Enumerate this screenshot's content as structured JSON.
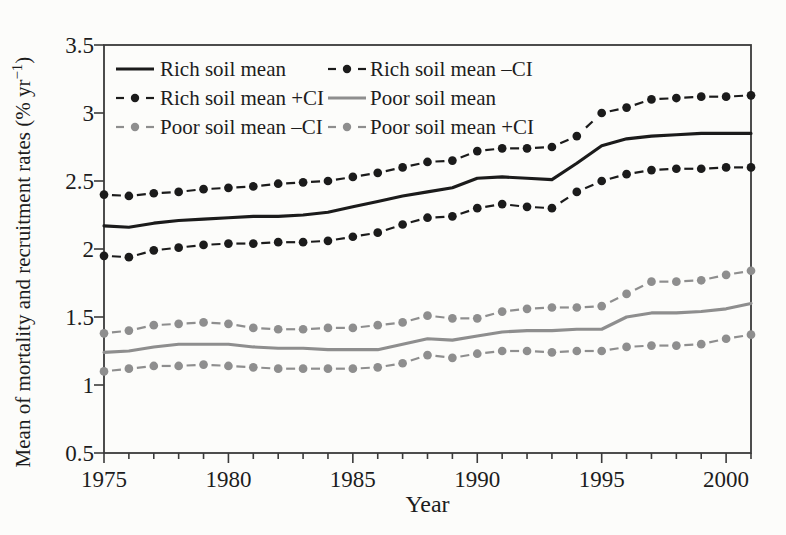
{
  "figure": {
    "kind": "scanned-book-line-chart",
    "background": "#fcfcfa",
    "frame_color": "#3a3a3a",
    "text_color": "#1d1d1d"
  },
  "chart_data": {
    "type": "line",
    "title": "",
    "xlabel": "Year",
    "ylabel": "Mean of mortality and recruitment rates (% yr−1)",
    "ylabel_parts": {
      "prefix": "Mean of mortality and recruitment rates (% yr",
      "sup": "−1",
      "suffix": ")"
    },
    "xlim": [
      1975,
      2001
    ],
    "ylim": [
      0.5,
      3.5
    ],
    "grid": false,
    "legend_position": "top-left-inside",
    "x_major_ticks": [
      1975,
      1980,
      1985,
      1990,
      1995,
      2000
    ],
    "x_tick_labels": [
      "1975",
      "1980",
      "1985",
      "1990",
      "1995",
      "2000"
    ],
    "x_minor_step": 1,
    "y_major_ticks": [
      0.5,
      1,
      1.5,
      2,
      2.5,
      3,
      3.5
    ],
    "y_tick_labels": [
      "0.5",
      "1",
      "1.5",
      "2",
      "2.5",
      "3",
      "3.5"
    ],
    "x": [
      1975,
      1976,
      1977,
      1978,
      1979,
      1980,
      1981,
      1982,
      1983,
      1984,
      1985,
      1986,
      1987,
      1988,
      1989,
      1990,
      1991,
      1992,
      1993,
      1994,
      1995,
      1996,
      1997,
      1998,
      1999,
      2000,
      2001
    ],
    "series": [
      {
        "name": "Rich soil mean",
        "style": "solid",
        "color": "#1b1b1b",
        "marker": "none",
        "values": [
          2.17,
          2.16,
          2.19,
          2.21,
          2.22,
          2.23,
          2.24,
          2.24,
          2.25,
          2.27,
          2.31,
          2.35,
          2.39,
          2.42,
          2.45,
          2.52,
          2.53,
          2.52,
          2.51,
          2.63,
          2.76,
          2.81,
          2.83,
          2.84,
          2.85,
          2.85,
          2.85
        ]
      },
      {
        "name": "Rich soil mean –CI",
        "style": "dash-dot",
        "color": "#1b1b1b",
        "marker": "circle",
        "values": [
          1.95,
          1.94,
          1.99,
          2.01,
          2.03,
          2.04,
          2.04,
          2.05,
          2.05,
          2.06,
          2.09,
          2.12,
          2.18,
          2.23,
          2.24,
          2.3,
          2.33,
          2.31,
          2.3,
          2.42,
          2.5,
          2.55,
          2.58,
          2.59,
          2.59,
          2.6,
          2.6
        ]
      },
      {
        "name": "Rich soil mean +CI",
        "style": "dash-dot",
        "color": "#1b1b1b",
        "marker": "circle",
        "values": [
          2.4,
          2.39,
          2.41,
          2.42,
          2.44,
          2.45,
          2.46,
          2.48,
          2.49,
          2.5,
          2.53,
          2.56,
          2.6,
          2.64,
          2.65,
          2.72,
          2.74,
          2.74,
          2.75,
          2.83,
          3.0,
          3.04,
          3.1,
          3.11,
          3.12,
          3.12,
          3.13
        ]
      },
      {
        "name": "Poor soil mean",
        "style": "solid",
        "color": "#8e8e8e",
        "marker": "none",
        "values": [
          1.24,
          1.25,
          1.28,
          1.3,
          1.3,
          1.3,
          1.28,
          1.27,
          1.27,
          1.26,
          1.26,
          1.26,
          1.3,
          1.34,
          1.33,
          1.36,
          1.39,
          1.4,
          1.4,
          1.41,
          1.41,
          1.5,
          1.53,
          1.53,
          1.54,
          1.56,
          1.6
        ]
      },
      {
        "name": "Poor soil mean –CI",
        "style": "dash-dot",
        "color": "#8e8e8e",
        "marker": "circle",
        "values": [
          1.1,
          1.12,
          1.14,
          1.14,
          1.15,
          1.14,
          1.13,
          1.12,
          1.12,
          1.12,
          1.12,
          1.13,
          1.16,
          1.22,
          1.2,
          1.23,
          1.25,
          1.25,
          1.24,
          1.25,
          1.25,
          1.28,
          1.29,
          1.29,
          1.3,
          1.34,
          1.37
        ]
      },
      {
        "name": "Poor soil mean +CI",
        "style": "dash-dot",
        "color": "#8e8e8e",
        "marker": "circle",
        "values": [
          1.38,
          1.4,
          1.44,
          1.45,
          1.46,
          1.45,
          1.42,
          1.41,
          1.41,
          1.42,
          1.42,
          1.44,
          1.46,
          1.51,
          1.49,
          1.49,
          1.54,
          1.56,
          1.57,
          1.57,
          1.58,
          1.67,
          1.76,
          1.76,
          1.77,
          1.81,
          1.84
        ]
      }
    ],
    "legend_rows": [
      [
        "Rich soil mean",
        "Rich soil mean –CI"
      ],
      [
        "Rich soil mean +CI",
        "Poor soil mean"
      ],
      [
        "Poor soil mean –CI",
        "Poor soil mean +CI"
      ]
    ]
  }
}
